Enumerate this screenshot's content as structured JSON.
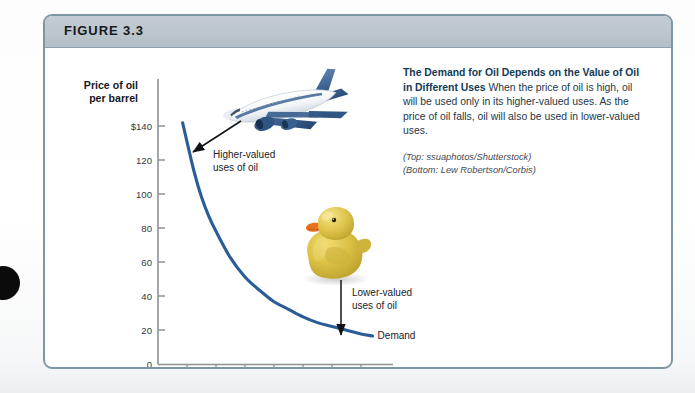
{
  "figure": {
    "number_label": "FIGURE 3.3",
    "header_color": "#bcc6cd",
    "border_color": "#7d96a4"
  },
  "caption": {
    "lead": "The Demand for Oil Depends on the Value of Oil in Different Uses",
    "body": " When the price of oil is high, oil will be used only in its higher-valued uses. As the price of oil falls, oil will also be used in lower-valued uses.",
    "credit_top": "(Top: ssuaphotos/Shutterstock)",
    "credit_bottom": "(Bottom: Lew Robertson/Corbis)",
    "text_color": "#23384a",
    "lead_color": "#123a57"
  },
  "chart_data": {
    "type": "line",
    "title": "",
    "xlabel": "Quantity of oil (MBD)",
    "ylabel": "Price of oil per barrel",
    "ylabel_line1": "Price of oil",
    "ylabel_line2": "per barrel",
    "xticks": [
      "0",
      "20",
      "40",
      "60",
      "80",
      "100",
      "120",
      "140"
    ],
    "xtick_values": [
      0,
      20,
      40,
      60,
      80,
      100,
      120,
      140
    ],
    "yticks": [
      "0",
      "20",
      "40",
      "60",
      "80",
      "100",
      "120",
      "$140"
    ],
    "ytick_values": [
      0,
      20,
      40,
      60,
      80,
      100,
      120,
      140
    ],
    "xlim": [
      0,
      160
    ],
    "ylim": [
      0,
      150
    ],
    "grid": false,
    "legend": "none",
    "series": [
      {
        "name": "Demand",
        "color": "#2a5d96",
        "x": [
          17,
          20,
          25,
          30,
          35,
          40,
          50,
          60,
          70,
          80,
          90,
          100,
          110,
          120,
          130,
          140,
          148
        ],
        "y": [
          127,
          117,
          101,
          88,
          78,
          70,
          56,
          46,
          39,
          33,
          29,
          25,
          22,
          20,
          18,
          16,
          15
        ]
      }
    ],
    "annotations": [
      {
        "id": "higher-valued",
        "line1": "Higher-valued",
        "line2": "uses of oil",
        "arrow": "arrow-to-upper-left"
      },
      {
        "id": "lower-valued",
        "line1": "Lower-valued",
        "line2": "uses of oil",
        "arrow": "arrow-down"
      }
    ],
    "curve_label": "Demand"
  },
  "images": {
    "airplane_alt": "airplane-photo",
    "duck_alt": "rubber-duck-photo"
  }
}
